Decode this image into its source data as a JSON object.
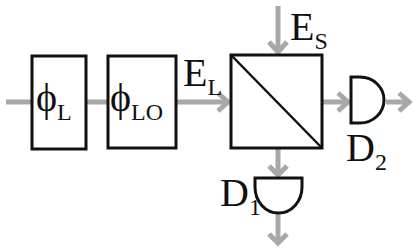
{
  "diagram": {
    "colors": {
      "beam": "#a8a8a8",
      "outline": "#111111",
      "background": "#ffffff"
    },
    "blocks": [
      {
        "id": "phase-L",
        "symbol": "ϕ",
        "subscript": "L"
      },
      {
        "id": "phase-LO",
        "symbol": "ϕ",
        "subscript": "LO"
      },
      {
        "id": "beam-splitter",
        "symbol": "",
        "subscript": ""
      }
    ],
    "fields": {
      "local": {
        "symbol": "E",
        "subscript": "L"
      },
      "signal": {
        "symbol": "E",
        "subscript": "S"
      }
    },
    "detectors": [
      {
        "id": "D1",
        "symbol": "D",
        "subscript": "1"
      },
      {
        "id": "D2",
        "symbol": "D",
        "subscript": "2"
      }
    ]
  }
}
